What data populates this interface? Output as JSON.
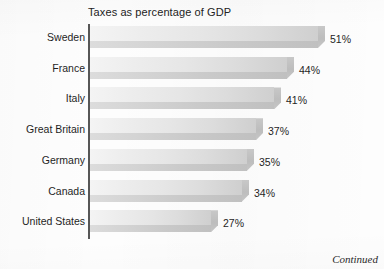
{
  "chart_data": {
    "type": "bar",
    "orientation": "horizontal",
    "title": "Taxes as percentage of GDP",
    "xlabel": "",
    "ylabel": "",
    "grid": false,
    "legend": false,
    "xlim": [
      0,
      51
    ],
    "value_suffix": "%",
    "categories": [
      "Sweden",
      "France",
      "Italy",
      "Great Britain",
      "Germany",
      "Canada",
      "United States"
    ],
    "values": [
      51,
      44,
      41,
      37,
      35,
      34,
      27
    ],
    "value_labels": [
      "51%",
      "44%",
      "41%",
      "37%",
      "35%",
      "34%",
      "27%"
    ],
    "bars": [
      {
        "category": "Sweden",
        "value": 51,
        "label": "51%"
      },
      {
        "category": "France",
        "value": 44,
        "label": "44%"
      },
      {
        "category": "Italy",
        "value": 41,
        "label": "41%"
      },
      {
        "category": "Great Britain",
        "value": 37,
        "label": "37%"
      },
      {
        "category": "Germany",
        "value": 35,
        "label": "35%"
      },
      {
        "category": "Canada",
        "value": 34,
        "label": "34%"
      },
      {
        "category": "United States",
        "value": 27,
        "label": "27%"
      }
    ]
  },
  "footer": {
    "continued_label": "Continued"
  },
  "colors": {
    "bar_top_light": "#f4f4f4",
    "bar_top_dark": "#cfcfcf",
    "bar_front": "#c9c9c9",
    "axis": "#575757",
    "text": "#1f1f1f",
    "background": "#fdfdfd"
  }
}
